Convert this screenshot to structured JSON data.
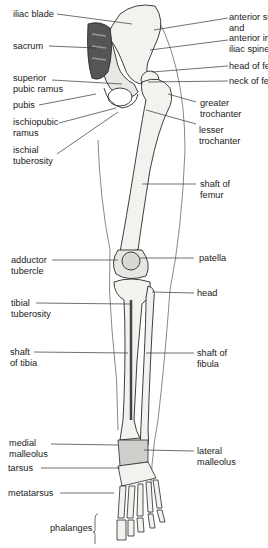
{
  "diagram": {
    "labels_left": [
      {
        "id": "iliac-blade",
        "lines": [
          "iliac blade"
        ]
      },
      {
        "id": "sacrum",
        "lines": [
          "sacrum"
        ]
      },
      {
        "id": "superior-pubic-ramus",
        "lines": [
          "superior",
          "pubic ramus"
        ]
      },
      {
        "id": "pubis",
        "lines": [
          "pubis"
        ]
      },
      {
        "id": "ischiopubic-ramus",
        "lines": [
          "ischiopubic",
          "ramus"
        ]
      },
      {
        "id": "ischial-tuberosity",
        "lines": [
          "ischial",
          "tuberosity"
        ]
      },
      {
        "id": "adductor-tubercle",
        "lines": [
          "adductor",
          "tubercle"
        ]
      },
      {
        "id": "tibial-tuberosity",
        "lines": [
          "tibial",
          "tuberosity"
        ]
      },
      {
        "id": "shaft-of-tibia",
        "lines": [
          "shaft",
          "of tibia"
        ]
      },
      {
        "id": "medial-malleolus",
        "lines": [
          "medial",
          "malleolus"
        ]
      },
      {
        "id": "tarsus",
        "lines": [
          "tarsus"
        ]
      },
      {
        "id": "metatarsus",
        "lines": [
          "metatarsus"
        ]
      },
      {
        "id": "phalanges",
        "lines": [
          "phalanges"
        ]
      }
    ],
    "labels_right": [
      {
        "id": "anterior-iliac-spines",
        "lines": [
          "anterior superior",
          "and",
          "anterior inferior",
          "iliac spines"
        ]
      },
      {
        "id": "head-of-femur",
        "lines": [
          "head of femur"
        ]
      },
      {
        "id": "neck-of-femur",
        "lines": [
          "neck of femur"
        ]
      },
      {
        "id": "greater-trochanter",
        "lines": [
          "greater",
          "trochanter"
        ]
      },
      {
        "id": "lesser-trochanter",
        "lines": [
          "lesser",
          "trochanter"
        ]
      },
      {
        "id": "shaft-of-femur",
        "lines": [
          "shaft of",
          "femur"
        ]
      },
      {
        "id": "patella",
        "lines": [
          "patella"
        ]
      },
      {
        "id": "head",
        "lines": [
          "head"
        ]
      },
      {
        "id": "shaft-of-fibula",
        "lines": [
          "shaft of",
          "fibula"
        ]
      },
      {
        "id": "lateral-malleolus",
        "lines": [
          "lateral",
          "malleolus"
        ]
      }
    ],
    "colors": {
      "bone": "#f2f2ee",
      "outline": "#2a2a2a",
      "shade": "#8a8a8a",
      "leader": "#333333",
      "text": "#1a1a1a"
    }
  }
}
